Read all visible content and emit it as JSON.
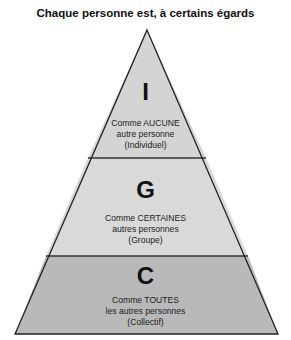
{
  "title": "Chaque personne est, à certains égards",
  "colors": {
    "top_fill": "#d4d4d4",
    "middle_fill": "#d9d9d9",
    "bottom_fill": "#b9b9b9",
    "stroke": "#222222"
  },
  "levels": [
    {
      "letter": "I",
      "line1": "Comme AUCUNE",
      "line2": "autre personne",
      "line3": "(Individuel)"
    },
    {
      "letter": "G",
      "line1": "Comme CERTAINES",
      "line2": "autres personnes",
      "line3": "(Groupe)"
    },
    {
      "letter": "C",
      "line1": "Comme TOUTES",
      "line2": "les autres personnes",
      "line3": "(Collectif)"
    }
  ]
}
